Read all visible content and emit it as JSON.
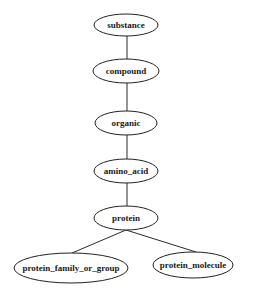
{
  "diagram": {
    "type": "hierarchy-tree",
    "colors": {
      "background": "#ffffff",
      "stroke": "#222222",
      "text": "#1a1a1a"
    },
    "nodes": [
      {
        "id": "substance",
        "label": "substance",
        "cx": 126,
        "cy": 25,
        "rx": 32,
        "ry": 11
      },
      {
        "id": "compound",
        "label": "compound",
        "cx": 126,
        "cy": 71,
        "rx": 33,
        "ry": 12
      },
      {
        "id": "organic",
        "label": "organic",
        "cx": 126,
        "cy": 123,
        "rx": 31,
        "ry": 12
      },
      {
        "id": "amino_acid",
        "label": "amino_acid",
        "cx": 126,
        "cy": 171,
        "rx": 32,
        "ry": 12
      },
      {
        "id": "protein",
        "label": "protein",
        "cx": 126,
        "cy": 218,
        "rx": 32,
        "ry": 12
      },
      {
        "id": "protein_family_or_group",
        "label": "protein_family_or_group",
        "cx": 71,
        "cy": 268,
        "rx": 57,
        "ry": 15
      },
      {
        "id": "protein_molecule",
        "label": "protein_molecule",
        "cx": 193,
        "cy": 265,
        "rx": 40,
        "ry": 13
      }
    ],
    "edges": [
      {
        "from": "substance",
        "to": "compound",
        "x1": 127,
        "y1": 36,
        "x2": 127,
        "y2": 59
      },
      {
        "from": "compound",
        "to": "organic",
        "x1": 127,
        "y1": 83,
        "x2": 127,
        "y2": 111
      },
      {
        "from": "organic",
        "to": "amino_acid",
        "x1": 127,
        "y1": 135,
        "x2": 127,
        "y2": 159
      },
      {
        "from": "amino_acid",
        "to": "protein",
        "x1": 127,
        "y1": 183,
        "x2": 127,
        "y2": 206
      },
      {
        "from": "protein",
        "to": "protein_family_or_group",
        "x1": 126,
        "y1": 230,
        "x2": 72,
        "y2": 253
      },
      {
        "from": "protein",
        "to": "protein_molecule",
        "x1": 126,
        "y1": 230,
        "x2": 196,
        "y2": 252
      }
    ]
  }
}
